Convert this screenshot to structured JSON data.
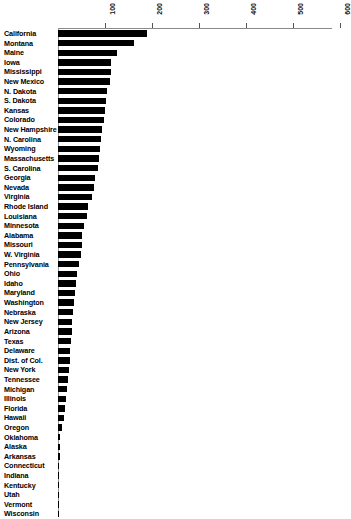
{
  "chart_data": {
    "type": "bar",
    "orientation": "horizontal",
    "title": "",
    "subtitle": "",
    "xlabel": "",
    "ylabel": "",
    "xlim": [
      0,
      620
    ],
    "xticks": [
      100,
      200,
      300,
      400,
      500,
      600
    ],
    "xtick_labels": [
      "100",
      "200",
      "300",
      "400",
      "500",
      "600"
    ],
    "grid": false,
    "legend": null,
    "axis_position": "top",
    "tick_label_rotation": -90,
    "bar_color": "#000000",
    "axis_color": "#8a8a8a",
    "categories": [
      "California",
      "Montana",
      "Maine",
      "Iowa",
      "Mississippi",
      "New Mexico",
      "N. Dakota",
      "S. Dakota",
      "Kansas",
      "Colorado",
      "New Hampshire",
      "N. Carolina",
      "Wyoming",
      "Massachusetts",
      "S. Carolina",
      "Georgia",
      "Nevada",
      "Virginia",
      "Rhode Island",
      "Louisiana",
      "Minnesota",
      "Alabama",
      "Missouri",
      "W. Virginia",
      "Pennsylvania",
      "Ohio",
      "Idaho",
      "Maryland",
      "Washington",
      "Nebraska",
      "New Jersey",
      "Arizona",
      "Texas",
      "Delaware",
      "Dist. of Col.",
      "New York",
      "Tennessee",
      "Michigan",
      "Illinois",
      "Florida",
      "Hawaii",
      "Oregon",
      "Oklahoma",
      "Alaska",
      "Arkansas",
      "Connecticut",
      "Indiana",
      "Kentucky",
      "Utah",
      "Vermont",
      "Wisconsin"
    ],
    "values": [
      190,
      162,
      126,
      112,
      112,
      110,
      104,
      103,
      100,
      97,
      93,
      92,
      90,
      87,
      86,
      79,
      77,
      72,
      63,
      61,
      56,
      52,
      50,
      48,
      45,
      40,
      38,
      37,
      35,
      32,
      30,
      29,
      27,
      26,
      25,
      23,
      22,
      20,
      16,
      14,
      12,
      9,
      5,
      4,
      4,
      3,
      3,
      2,
      2,
      2,
      1
    ]
  }
}
